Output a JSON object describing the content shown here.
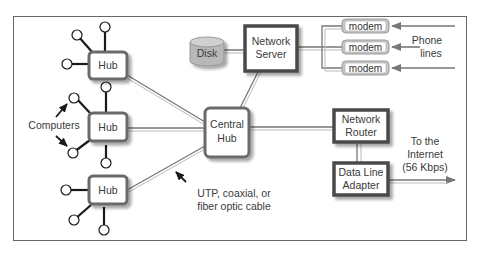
{
  "diagram": {
    "title": "",
    "nodes": {
      "hub_top": {
        "label": "Hub"
      },
      "hub_middle": {
        "label": "Hub"
      },
      "hub_bottom": {
        "label": "Hub"
      },
      "central_hub": {
        "line1": "Central",
        "line2": "Hub"
      },
      "disk": {
        "label": "Disk"
      },
      "network_server": {
        "line1": "Network",
        "line2": "Server"
      },
      "modems": [
        {
          "label": "modem"
        },
        {
          "label": "modem"
        },
        {
          "label": "modem"
        }
      ],
      "network_router": {
        "line1": "Network",
        "line2": "Router"
      },
      "data_line_adapter": {
        "line1": "Data Line",
        "line2": "Adapter"
      }
    },
    "annotations": {
      "computers": "Computers",
      "phone_lines": {
        "line1": "Phone",
        "line2": "lines"
      },
      "cable": {
        "line1": "UTP, coaxial, or",
        "line2": "fiber optic cable"
      },
      "internet": {
        "line1": "To the",
        "line2": "Internet",
        "line3": "(56 Kbps)"
      }
    },
    "colors": {
      "box_border": "#4a4a4a",
      "hub_border": "#6b6b6b",
      "line": "#7a7a7a",
      "modem_fill": "#c8c8c8",
      "disk_fill": "#b5b5b5",
      "frame": "#555555"
    },
    "icons": {
      "computer": "circle-node-icon",
      "arrow": "arrow-icon",
      "disk": "cylinder-icon"
    }
  }
}
